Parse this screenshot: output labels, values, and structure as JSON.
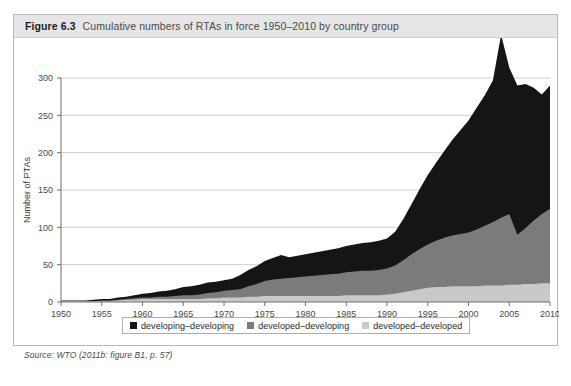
{
  "figure": {
    "label": "Figure 6.3",
    "caption": "Cumulative numbers of RTAs in force 1950–2010 by country group",
    "source": "Source: WTO (2011b: figure B1, p. 57)"
  },
  "legend": {
    "items": [
      {
        "label": "developing–developing",
        "color": "#151515"
      },
      {
        "label": "developed–developing",
        "color": "#7b7b7b"
      },
      {
        "label": "developed–developed",
        "color": "#c9c9c9"
      }
    ]
  },
  "chart_data": {
    "type": "area",
    "stacked": true,
    "title": "Cumulative numbers of RTAs in force 1950–2010 by country group",
    "xlabel": "",
    "ylabel": "Number of PTAs",
    "xlim": [
      1950,
      2010
    ],
    "ylim": [
      0,
      300
    ],
    "yticks": [
      0,
      50,
      100,
      150,
      200,
      250,
      300
    ],
    "xticks": [
      1950,
      1955,
      1960,
      1965,
      1970,
      1975,
      1980,
      1985,
      1990,
      1995,
      2000,
      2005,
      2010
    ],
    "grid": "horizontal",
    "legend_position": "bottom",
    "x": [
      1950,
      1951,
      1952,
      1953,
      1954,
      1955,
      1956,
      1957,
      1958,
      1959,
      1960,
      1961,
      1962,
      1963,
      1964,
      1965,
      1966,
      1967,
      1968,
      1969,
      1970,
      1971,
      1972,
      1973,
      1974,
      1975,
      1976,
      1977,
      1978,
      1979,
      1980,
      1981,
      1982,
      1983,
      1984,
      1985,
      1986,
      1987,
      1988,
      1989,
      1990,
      1991,
      1992,
      1993,
      1994,
      1995,
      1996,
      1997,
      1998,
      1999,
      2000,
      2001,
      2002,
      2003,
      2004,
      2005,
      2006,
      2007,
      2008,
      2009,
      2010
    ],
    "series": [
      {
        "name": "developed–developed",
        "color": "#c9c9c9",
        "values": [
          1,
          1,
          1,
          1,
          1,
          1,
          1,
          2,
          3,
          3,
          4,
          4,
          4,
          4,
          4,
          4,
          4,
          4,
          5,
          5,
          6,
          6,
          6,
          7,
          7,
          8,
          8,
          8,
          8,
          8,
          8,
          8,
          8,
          8,
          8,
          9,
          9,
          9,
          9,
          9,
          10,
          11,
          13,
          15,
          17,
          19,
          20,
          20,
          21,
          21,
          21,
          21,
          22,
          22,
          22,
          23,
          23,
          24,
          24,
          25,
          25
        ]
      },
      {
        "name": "developed–developing",
        "color": "#7b7b7b",
        "values": [
          0,
          0,
          0,
          0,
          0,
          1,
          1,
          1,
          1,
          2,
          2,
          2,
          3,
          3,
          4,
          5,
          5,
          6,
          7,
          8,
          9,
          10,
          11,
          14,
          17,
          20,
          22,
          23,
          24,
          25,
          26,
          27,
          28,
          29,
          30,
          31,
          32,
          33,
          33,
          34,
          35,
          38,
          43,
          49,
          54,
          58,
          62,
          66,
          68,
          70,
          72,
          76,
          80,
          85,
          91,
          95,
          67,
          75,
          85,
          93,
          100
        ]
      },
      {
        "name": "developing–developing",
        "color": "#151515",
        "values": [
          1,
          1,
          1,
          1,
          2,
          2,
          2,
          3,
          3,
          4,
          5,
          6,
          7,
          8,
          9,
          11,
          12,
          13,
          14,
          14,
          14,
          15,
          19,
          22,
          24,
          27,
          29,
          32,
          28,
          29,
          30,
          31,
          32,
          33,
          34,
          35,
          36,
          37,
          38,
          39,
          40,
          45,
          55,
          67,
          80,
          93,
          104,
          116,
          128,
          139,
          150,
          163,
          175,
          190,
          245,
          196,
          200,
          193,
          178,
          160,
          165
        ]
      }
    ],
    "totals": [
      2,
      2,
      2,
      2,
      3,
      4,
      4,
      6,
      7,
      9,
      11,
      12,
      14,
      15,
      17,
      20,
      21,
      23,
      26,
      27,
      29,
      31,
      36,
      43,
      48,
      55,
      59,
      63,
      60,
      62,
      64,
      66,
      68,
      70,
      72,
      75,
      77,
      79,
      80,
      82,
      85,
      94,
      111,
      131,
      151,
      170,
      186,
      202,
      217,
      230,
      243,
      260,
      277,
      297,
      358,
      314,
      290,
      292,
      287,
      278,
      290
    ]
  }
}
